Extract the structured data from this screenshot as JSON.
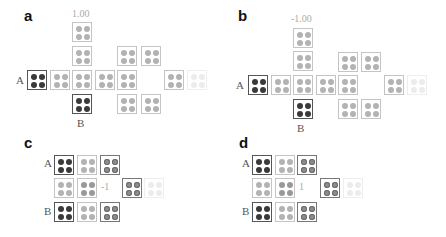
{
  "panels": {
    "a": {
      "label": "a",
      "value": "1.00",
      "node_a": "A",
      "node_b": "B"
    },
    "b": {
      "label": "b",
      "value": "-1.00",
      "node_a": "A",
      "node_b": "B"
    },
    "c": {
      "label": "c",
      "value": "-1",
      "node_a": "A",
      "node_b": "B"
    },
    "d": {
      "label": "d",
      "value": "1",
      "node_a": "A",
      "node_b": "B"
    }
  },
  "colors": {
    "dark_dot": "#3a3a3a",
    "light_dot": "#b3b3b3",
    "ring_dot": "#8d8d8d",
    "faint_dot": "#ececec",
    "dark_border": "#555555",
    "light_border": "#c4c4c4"
  }
}
